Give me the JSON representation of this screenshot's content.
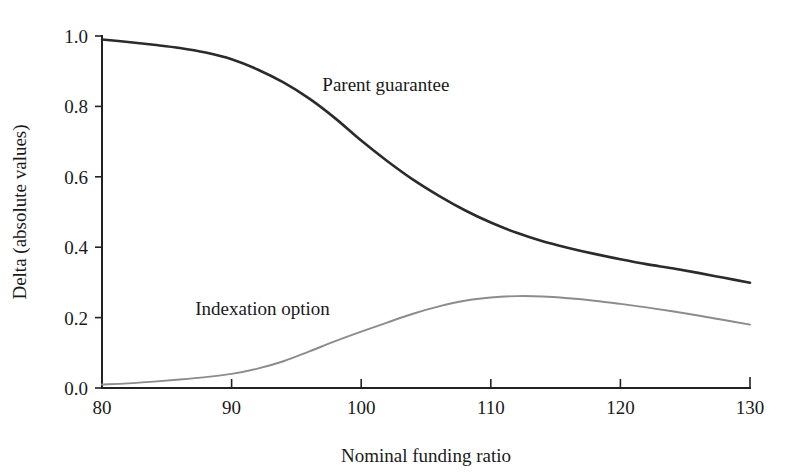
{
  "chart_data": {
    "type": "line",
    "title": "",
    "subtitle": "",
    "xlabel": "Nominal funding ratio",
    "ylabel": "Delta (absolute values)",
    "xlim": [
      80,
      130
    ],
    "ylim": [
      0.0,
      1.0
    ],
    "grid": false,
    "legend_position": "inline-annotations",
    "xticks": [
      "80",
      "90",
      "100",
      "110",
      "120",
      "130"
    ],
    "xtick_values": [
      80,
      90,
      100,
      110,
      120,
      130
    ],
    "yticks": [
      "0.0",
      "0.2",
      "0.4",
      "0.6",
      "0.8",
      "1.0"
    ],
    "ytick_values": [
      0.0,
      0.2,
      0.4,
      0.6,
      0.8,
      1.0
    ],
    "x": [
      80,
      82,
      84,
      86,
      88,
      90,
      92,
      94,
      96,
      98,
      100,
      102,
      104,
      106,
      108,
      110,
      112,
      114,
      116,
      118,
      120,
      122,
      124,
      126,
      128,
      130
    ],
    "series": [
      {
        "name": "Parent guarantee",
        "color": "#2b2b2b",
        "width": 2.6,
        "label_x": 97,
        "label_y": 0.845,
        "values": [
          0.99,
          0.983,
          0.975,
          0.966,
          0.953,
          0.934,
          0.905,
          0.868,
          0.822,
          0.766,
          0.703,
          0.645,
          0.592,
          0.546,
          0.505,
          0.47,
          0.441,
          0.417,
          0.398,
          0.381,
          0.366,
          0.352,
          0.34,
          0.327,
          0.313,
          0.299
        ]
      },
      {
        "name": "Indexation option",
        "color": "#8c8c8c",
        "width": 1.9,
        "label_x": 87.2,
        "label_y": 0.206,
        "values": [
          0.01,
          0.013,
          0.018,
          0.024,
          0.031,
          0.04,
          0.055,
          0.076,
          0.104,
          0.133,
          0.16,
          0.186,
          0.211,
          0.232,
          0.248,
          0.257,
          0.261,
          0.26,
          0.255,
          0.248,
          0.239,
          0.229,
          0.218,
          0.206,
          0.193,
          0.18
        ]
      }
    ]
  },
  "axes": {
    "x_axis_name": "x-axis",
    "y_axis_name": "y-axis"
  }
}
